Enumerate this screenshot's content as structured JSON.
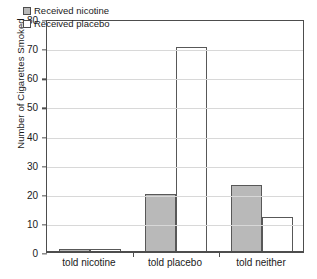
{
  "chart_data": {
    "type": "bar",
    "title": "",
    "xlabel": "",
    "ylabel": "Number of Cigarettes Smoked",
    "categories": [
      "told nicotine",
      "told placebo",
      "told neither"
    ],
    "series": [
      {
        "name": "Received nicotine",
        "color": "#b9b9b9",
        "values": [
          1,
          20,
          23
        ]
      },
      {
        "name": "Received placebo",
        "color": "#ffffff",
        "values": [
          1,
          70.5,
          12
        ]
      }
    ],
    "ylim": [
      0,
      80
    ],
    "ytick_step": 10,
    "yticks": [
      0,
      10,
      20,
      30,
      40,
      50,
      60,
      70,
      80
    ],
    "ytick_labels": [
      "0",
      "10",
      "20",
      "30",
      "40",
      "50",
      "60",
      "70",
      "80"
    ],
    "grid": "horizontal",
    "legend_position": "top-left-inside",
    "frame": "box",
    "border_color": "#4d4d4d",
    "gridline_color": "#d8d8d8"
  },
  "legend": {
    "entries": [
      {
        "label": "Received nicotine",
        "swatch": "gray-filled-square"
      },
      {
        "label": "Received placebo",
        "swatch": "white-square"
      }
    ]
  }
}
